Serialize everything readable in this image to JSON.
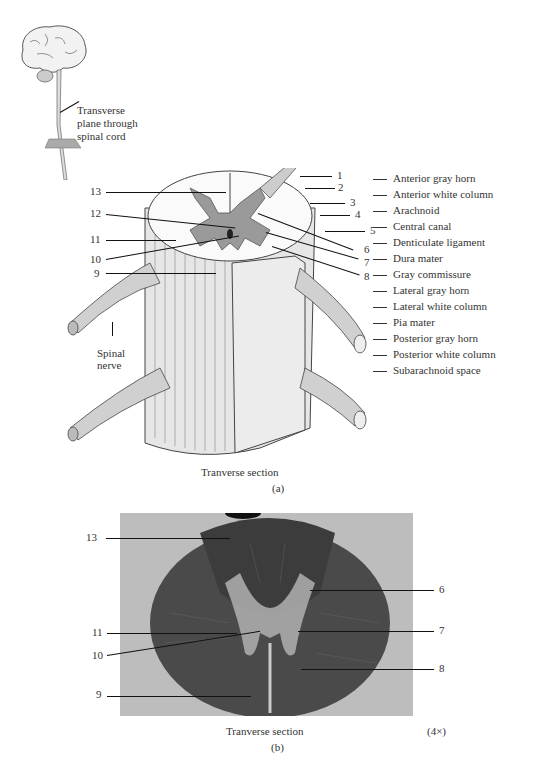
{
  "inset": {
    "label_line1": "Transverse",
    "label_line2": "plane through",
    "label_line3": "spinal cord"
  },
  "figure_a": {
    "callouts_left": [
      "13",
      "12",
      "11",
      "10",
      "9"
    ],
    "callouts_right": [
      "1",
      "2",
      "3",
      "4",
      "5",
      "6",
      "7",
      "8"
    ],
    "spinal_nerve_line1": "Spinal",
    "spinal_nerve_line2": "nerve",
    "caption": "Tranverse section",
    "panel_label": "(a)"
  },
  "key": {
    "items": [
      "Anterior gray horn",
      "Anterior white column",
      "Arachnoid",
      "Central canal",
      "Denticulate ligament",
      "Dura mater",
      "Gray commissure",
      "Lateral gray horn",
      "Lateral white column",
      "Pia mater",
      "Posterior gray horn",
      "Posterior white column",
      "Subarachnoid space"
    ]
  },
  "figure_b": {
    "callouts_left": [
      "13",
      "11",
      "10",
      "9"
    ],
    "callouts_right": [
      "6",
      "7",
      "8"
    ],
    "caption": "Tranverse section",
    "magnification": "(4×)",
    "panel_label": "(b)"
  }
}
